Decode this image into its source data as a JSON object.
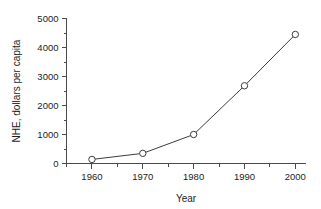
{
  "chart_data": {
    "type": "line",
    "title": "",
    "xlabel": "Year",
    "ylabel": "NHE, dollars per capita",
    "x": [
      1960,
      1970,
      1980,
      1990,
      2000
    ],
    "values": [
      140,
      350,
      1000,
      2680,
      4450
    ],
    "categories": [
      "1960",
      "1970",
      "1980",
      "1990",
      "2000"
    ],
    "xlim": [
      1955,
      2002
    ],
    "ylim": [
      0,
      5000
    ],
    "xticks": [
      1960,
      1970,
      1980,
      1990,
      2000
    ],
    "xtick_labels": [
      "1960",
      "1970",
      "1980",
      "1990",
      "2000"
    ],
    "x_minor_ticks": [
      1955,
      1965,
      1975,
      1985,
      1995
    ],
    "yticks": [
      0,
      1000,
      2000,
      3000,
      4000,
      5000
    ],
    "ytick_labels": [
      "0",
      "1000",
      "2000",
      "3000",
      "4000",
      "5000"
    ],
    "y_minor_ticks": [
      500,
      1500,
      2500,
      3500,
      4500
    ],
    "grid": false,
    "legend": false,
    "legend_position": "none",
    "marker": "open-circle",
    "line_color": "#3c3c3c",
    "marker_fill": "#ffffff",
    "background_color": "#ffffff",
    "axis_color": "#4a4a4a"
  }
}
